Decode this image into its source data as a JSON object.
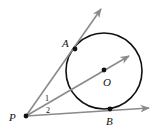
{
  "diagram": {
    "colors": {
      "ray": "#8a8a8a",
      "circle": "#111111",
      "point": "#111111",
      "text": "#111111"
    },
    "circle": {
      "center_label": "O",
      "cx": 104,
      "cy": 71,
      "r": 38
    },
    "points": [
      {
        "id": "P",
        "label": "P",
        "x": 26,
        "y": 116
      },
      {
        "id": "A",
        "label": "A",
        "x": 75,
        "y": 49
      },
      {
        "id": "O",
        "label": "O",
        "x": 104,
        "y": 70
      },
      {
        "id": "B",
        "label": "B",
        "x": 110,
        "y": 109
      }
    ],
    "rays": [
      {
        "id": "PA",
        "from": "P",
        "through": "A",
        "tip": [
          101,
          9
        ]
      },
      {
        "id": "PO",
        "from": "P",
        "through": "O",
        "tip": [
          129,
          56
        ]
      },
      {
        "id": "PB",
        "from": "P",
        "through": "B",
        "tip": [
          149,
          108
        ]
      }
    ],
    "angle_labels": [
      {
        "label": "1",
        "x": 47,
        "y": 98
      },
      {
        "label": "2",
        "x": 48,
        "y": 111
      }
    ],
    "labels": {
      "P": "P",
      "A": "A",
      "O": "O",
      "B": "B",
      "angle1": "1",
      "angle2": "2"
    }
  }
}
